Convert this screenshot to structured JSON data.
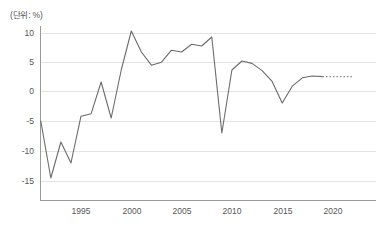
{
  "chart_data": {
    "type": "line",
    "title": "",
    "subtitle": "",
    "unit_label": "(단위: %)",
    "xlabel": "",
    "ylabel": "",
    "ylim": [
      -17.5,
      12
    ],
    "xlim": [
      1991,
      2024
    ],
    "grid": true,
    "legend": false,
    "y_ticks": [
      "10",
      "5",
      "0",
      "-5",
      "-10",
      "-15"
    ],
    "y_tick_values": [
      10,
      5,
      0,
      -5,
      -10,
      -15
    ],
    "x_ticks": [
      "1995",
      "2000",
      "2005",
      "2010",
      "2015",
      "2020"
    ],
    "x_tick_values": [
      1995,
      2000,
      2005,
      2010,
      2015,
      2020
    ],
    "series": [
      {
        "name": "actual",
        "style": "solid",
        "color": "#6b6b6b",
        "x": [
          1991,
          1992,
          1993,
          1994,
          1995,
          1996,
          1997,
          1998,
          1999,
          2000,
          2001,
          2002,
          2003,
          2004,
          2005,
          2006,
          2007,
          2008,
          2009,
          2010,
          2011,
          2012,
          2013,
          2014,
          2015,
          2016,
          2017,
          2018,
          2019
        ],
        "values": [
          -5.0,
          -14.5,
          -8.5,
          -12.0,
          -4.2,
          -3.8,
          1.5,
          -4.5,
          3.5,
          10.0,
          6.5,
          4.3,
          4.8,
          6.8,
          6.5,
          7.8,
          7.5,
          9.0,
          -7.0,
          3.5,
          5.0,
          4.6,
          3.4,
          1.6,
          -2.0,
          0.8,
          2.2,
          2.5,
          2.4
        ]
      },
      {
        "name": "forecast",
        "style": "dotted",
        "color": "#8d8d8d",
        "x": [
          2019,
          2022
        ],
        "values": [
          2.4,
          2.4
        ]
      }
    ]
  }
}
